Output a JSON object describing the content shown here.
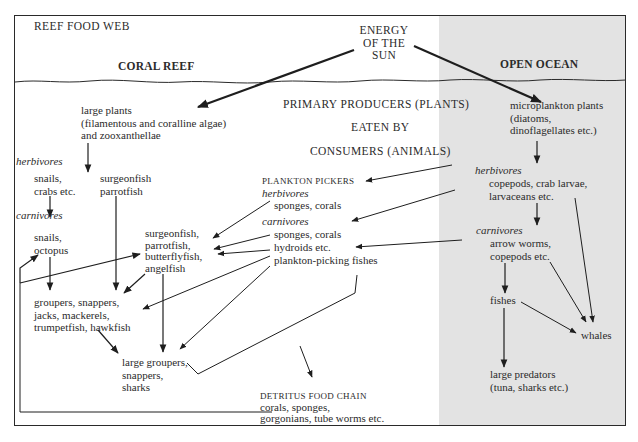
{
  "title": "REEF FOOD WEB",
  "sun": "ENERGY\nOF THE\nSUN",
  "regions": {
    "coral_reef": "CORAL REEF",
    "open_ocean": "OPEN OCEAN"
  },
  "center_legend": {
    "line1": "PRIMARY PRODUCERS (PLANTS)",
    "line2": "EATEN BY",
    "line3": "CONSUMERS (ANIMALS)"
  },
  "reef": {
    "large_plants": "large plants\n(filamentous and coralline algae)\nand zooxanthellae",
    "herbivores_label": "herbivores",
    "snails_crabs": "snails,\ncrabs etc.",
    "surgeon_parrot": "surgeonfish\nparrotfish",
    "carnivores_label": "carnivores",
    "snails_octopus": "snails,\noctopus",
    "fish_group": "surgeonfish,\nparrotfish,\nbutterflyfish,\nangelfish",
    "groupers": "groupers, snappers,\njacks, mackerels,\ntrumpetfish, hawkfish",
    "large_groupers": "large groupers,\nsnappers,\nsharks"
  },
  "plankton_pickers": {
    "heading": "PLANKTON PICKERS",
    "herbivores_label": "herbivores",
    "herb_items": "sponges, corals",
    "carnivores_label": "carnivores",
    "carn_items": "sponges, corals\nhydroids etc.\nplankton-picking fishes"
  },
  "detritus": {
    "heading": "DETRITUS FOOD CHAIN",
    "items": "corals, sponges,\ngorgonians, tube worms etc."
  },
  "ocean": {
    "microplankton": "microplankton plants\n(diatoms,\ndinoflagellates etc.)",
    "herbivores_label": "herbivores",
    "copepods": "copepods, crab larvae,\nlarvaceans etc.",
    "carnivores_label": "carnivores",
    "arrow_worms": "arrow worms,\ncopepods etc.",
    "fishes": "fishes",
    "whales": "whales",
    "large_predators": "large predators\n(tuna, sharks etc.)"
  },
  "colors": {
    "ink": "#2a2a2a",
    "paper": "#ffffff",
    "ocean_shade": "#e3e3e3"
  }
}
